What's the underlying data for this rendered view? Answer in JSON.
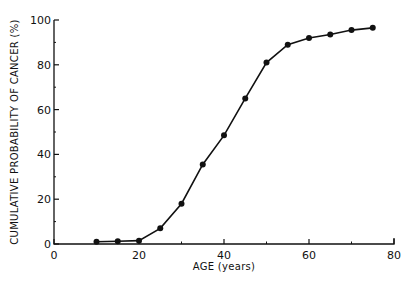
{
  "chart_data": {
    "type": "line",
    "title": "",
    "xlabel": "AGE (years)",
    "ylabel": "CUMULATIVE PROBABILITY OF CANCER (%)",
    "xlim": [
      0,
      80
    ],
    "ylim": [
      0,
      100
    ],
    "x_ticks": [
      "0",
      "20",
      "40",
      "60",
      "80"
    ],
    "y_ticks": [
      "0",
      "20",
      "40",
      "60",
      "80",
      "100"
    ],
    "grid": false,
    "legend": null,
    "series": [
      {
        "name": "Cumulative probability",
        "x": [
          10,
          15,
          20,
          25,
          30,
          35,
          40,
          45,
          50,
          55,
          60,
          65,
          70,
          75
        ],
        "values": [
          1,
          1.2,
          1.5,
          7,
          18,
          35.5,
          48.5,
          65,
          81,
          89,
          92,
          93.5,
          95.5,
          96.5
        ]
      }
    ]
  }
}
